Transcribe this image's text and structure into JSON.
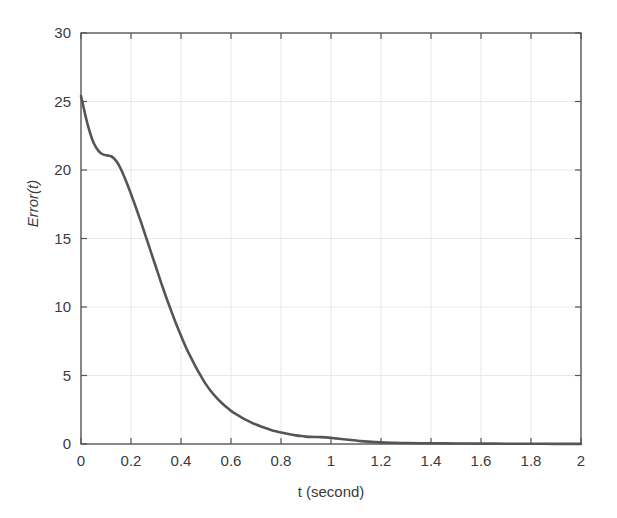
{
  "chart_data": {
    "type": "line",
    "title": "",
    "xlabel": "t (second)",
    "ylabel": "Error(t)",
    "xlim": [
      0,
      2
    ],
    "ylim": [
      0,
      30
    ],
    "grid": true,
    "legend": null,
    "legend_position": "none",
    "xticks": [
      0,
      0.2,
      0.4,
      0.6,
      0.8,
      1,
      1.2,
      1.4,
      1.6,
      1.8,
      2
    ],
    "xticklabels": [
      "0",
      "0.2",
      "0.4",
      "0.6",
      "0.8",
      "1",
      "1.2",
      "1.4",
      "1.6",
      "1.8",
      "2"
    ],
    "yticks": [
      0,
      5,
      10,
      15,
      20,
      25,
      30
    ],
    "yticklabels": [
      "0",
      "5",
      "10",
      "15",
      "20",
      "25",
      "30"
    ],
    "line_color": "#555555",
    "line_width": 2.6,
    "series": [
      {
        "name": "Error(t)",
        "x": [
          0.0,
          0.01,
          0.02,
          0.03,
          0.04,
          0.05,
          0.06,
          0.07,
          0.08,
          0.09,
          0.1,
          0.11,
          0.12,
          0.13,
          0.14,
          0.15,
          0.16,
          0.18,
          0.2,
          0.22,
          0.24,
          0.26,
          0.28,
          0.3,
          0.32,
          0.34,
          0.36,
          0.38,
          0.4,
          0.42,
          0.44,
          0.46,
          0.48,
          0.5,
          0.52,
          0.54,
          0.56,
          0.58,
          0.6,
          0.62,
          0.64,
          0.66,
          0.68,
          0.7,
          0.72,
          0.74,
          0.76,
          0.78,
          0.8,
          0.82,
          0.84,
          0.86,
          0.88,
          0.9,
          0.92,
          0.94,
          0.96,
          0.98,
          1.0,
          1.02,
          1.04,
          1.06,
          1.08,
          1.1,
          1.12,
          1.15,
          1.2,
          1.25,
          1.3,
          1.4,
          1.5,
          1.6,
          1.7,
          1.8,
          1.9,
          2.0
        ],
        "y": [
          25.4,
          24.6,
          23.8,
          23.1,
          22.5,
          22.0,
          21.65,
          21.4,
          21.22,
          21.12,
          21.08,
          21.05,
          21.0,
          20.88,
          20.68,
          20.4,
          20.05,
          19.2,
          18.25,
          17.25,
          16.2,
          15.1,
          14.0,
          12.9,
          11.8,
          10.75,
          9.75,
          8.8,
          7.9,
          7.05,
          6.3,
          5.6,
          4.95,
          4.35,
          3.85,
          3.42,
          3.05,
          2.72,
          2.42,
          2.18,
          1.96,
          1.76,
          1.58,
          1.42,
          1.28,
          1.15,
          1.03,
          0.93,
          0.84,
          0.76,
          0.69,
          0.63,
          0.58,
          0.54,
          0.52,
          0.51,
          0.5,
          0.48,
          0.45,
          0.41,
          0.37,
          0.33,
          0.29,
          0.25,
          0.21,
          0.17,
          0.12,
          0.09,
          0.07,
          0.05,
          0.04,
          0.03,
          0.02,
          0.02,
          0.01,
          0.01
        ]
      }
    ]
  },
  "axes": {
    "box_color": "#555555",
    "grid_color": "#e8e8e8",
    "tick_color": "#555555"
  }
}
